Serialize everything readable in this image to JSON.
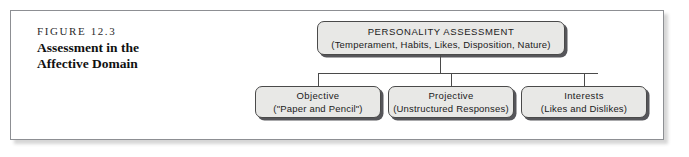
{
  "figure": {
    "number": "FIGURE 12.3",
    "title": "Assessment in the Affective Domain"
  },
  "diagram": {
    "type": "hierarchy",
    "root": {
      "title": "PERSONALITY ASSESSMENT",
      "subtitle": "(Temperament, Habits, Likes, Disposition, Nature)"
    },
    "children": [
      {
        "title": "Objective",
        "subtitle": "(\"Paper and Pencil\")"
      },
      {
        "title": "Projective",
        "subtitle": "(Unstructured Responses)"
      },
      {
        "title": "Interests",
        "subtitle": "(Likes and Dislikes)"
      }
    ]
  },
  "colors": {
    "node_fill": "#e8e8e6",
    "node_border": "#4a4a4a",
    "node_shadow": "#56565a",
    "frame_border": "#8d8f93",
    "text": "#1b1b1b",
    "page_background": "#ffffff"
  }
}
